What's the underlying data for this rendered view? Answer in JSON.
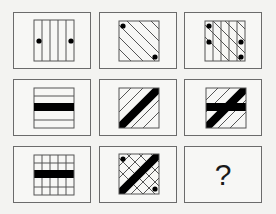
{
  "puzzle": {
    "type": "3x3 figure matrix reasoning puzzle",
    "colors": {
      "line": "#333333",
      "border": "#6b6b6b",
      "fill": "#000000",
      "background": "#f7f7f5"
    },
    "cells": [
      {
        "row": 1,
        "col": 1,
        "pattern": "vertical-lines",
        "band": "none",
        "dots": "left-middle, right-middle"
      },
      {
        "row": 1,
        "col": 2,
        "pattern": "diagonal-lines-down-right",
        "band": "none",
        "dots": "top-left, bottom-right"
      },
      {
        "row": 1,
        "col": 3,
        "pattern": "vertical-lines + diagonal-lines-down-right",
        "band": "none",
        "dots": "top-left, left-middle, right-middle, bottom-right"
      },
      {
        "row": 2,
        "col": 1,
        "pattern": "horizontal-lines",
        "band": "horizontal-black",
        "dots": "none"
      },
      {
        "row": 2,
        "col": 2,
        "pattern": "diagonal-lines-up-right",
        "band": "diagonal-black-up-right",
        "dots": "none"
      },
      {
        "row": 2,
        "col": 3,
        "pattern": "diagonal-lines-up-right",
        "band": "horizontal-black + diagonal-black-up-right",
        "dots": "none"
      },
      {
        "row": 3,
        "col": 1,
        "pattern": "grid",
        "band": "horizontal-black",
        "dots": "none"
      },
      {
        "row": 3,
        "col": 2,
        "pattern": "diagonal-crosshatch",
        "band": "diagonal-black-up-right",
        "dots": "top-left, bottom-right"
      },
      {
        "row": 3,
        "col": 3,
        "pattern": "unknown",
        "label": "?"
      }
    ]
  }
}
